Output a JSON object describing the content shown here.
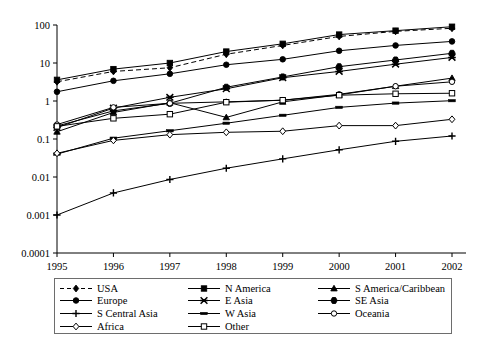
{
  "chart_data": {
    "type": "line",
    "title": "",
    "xlabel": "",
    "ylabel": "",
    "x": [
      "1995",
      "1996",
      "1997",
      "1998",
      "1999",
      "2000",
      "2001",
      "2002"
    ],
    "yscale": "log",
    "ylim": [
      0.0001,
      100
    ],
    "ytick_labels": [
      "100",
      "10",
      "1",
      "0.1",
      "0.01",
      "0.001",
      "0.0001"
    ],
    "ytick_values": [
      100,
      10,
      1,
      0.1,
      0.01,
      0.001,
      0.0001
    ],
    "grid": false,
    "legend_position": "below",
    "series": [
      {
        "name": "USA",
        "marker": "diamond-filled",
        "dash": true,
        "values": [
          3.2,
          6.0,
          7.5,
          17.0,
          29.0,
          50.0,
          68.0,
          82.0
        ]
      },
      {
        "name": "N America",
        "marker": "square-filled",
        "dash": false,
        "values": [
          3.6,
          6.9,
          10.0,
          20.0,
          32.0,
          56.0,
          71.0,
          90.0
        ]
      },
      {
        "name": "S America/Caribbean",
        "marker": "triangle-filled",
        "dash": false,
        "values": [
          0.155,
          0.5,
          0.9,
          0.37,
          0.95,
          1.45,
          2.45,
          4.0
        ]
      },
      {
        "name": "Europe",
        "marker": "circle-filled",
        "dash": false,
        "values": [
          1.75,
          3.4,
          5.2,
          9.0,
          12.5,
          21.0,
          29.0,
          37.0
        ]
      },
      {
        "name": "E Asia",
        "marker": "star-filled",
        "dash": false,
        "values": [
          0.2,
          0.65,
          1.25,
          2.1,
          4.1,
          6.0,
          9.3,
          14.0
        ]
      },
      {
        "name": "SE Asia",
        "marker": "hexagon-filled",
        "dash": false,
        "values": [
          0.22,
          0.55,
          0.87,
          2.3,
          4.3,
          8.0,
          12.0,
          18.0
        ]
      },
      {
        "name": "S Central Asia",
        "marker": "plus",
        "dash": false,
        "values": [
          0.001,
          0.0038,
          0.0086,
          0.017,
          0.03,
          0.052,
          0.087,
          0.12
        ]
      },
      {
        "name": "W Asia",
        "marker": "dash-filled",
        "dash": false,
        "values": [
          0.04,
          0.105,
          0.165,
          0.26,
          0.42,
          0.68,
          0.88,
          1.02
        ]
      },
      {
        "name": "Oceania",
        "marker": "circle-open",
        "dash": false,
        "values": [
          0.24,
          0.68,
          0.87,
          0.95,
          1.05,
          1.5,
          2.45,
          3.2
        ]
      },
      {
        "name": "Africa",
        "marker": "diamond-open",
        "dash": false,
        "values": [
          0.042,
          0.092,
          0.13,
          0.15,
          0.16,
          0.225,
          0.225,
          0.33
        ]
      },
      {
        "name": "Other",
        "marker": "square-open",
        "dash": false,
        "values": [
          0.215,
          0.35,
          0.45,
          0.93,
          1.05,
          1.42,
          1.55,
          1.6
        ]
      }
    ]
  },
  "legend": {
    "items": [
      {
        "label": "USA",
        "marker": "diamond-filled",
        "dash": true
      },
      {
        "label": "N America",
        "marker": "square-filled",
        "dash": false
      },
      {
        "label": "S America/Caribbean",
        "marker": "triangle-filled",
        "dash": false
      },
      {
        "label": "Europe",
        "marker": "circle-filled",
        "dash": false
      },
      {
        "label": "E Asia",
        "marker": "star-filled",
        "dash": false
      },
      {
        "label": "SE Asia",
        "marker": "hexagon-filled",
        "dash": false
      },
      {
        "label": "S Central Asia",
        "marker": "plus",
        "dash": false
      },
      {
        "label": "W Asia",
        "marker": "dash-filled",
        "dash": false
      },
      {
        "label": "Oceania",
        "marker": "circle-open",
        "dash": false
      },
      {
        "label": "Africa",
        "marker": "diamond-open",
        "dash": false
      },
      {
        "label": "Other",
        "marker": "square-open",
        "dash": false
      }
    ]
  },
  "colors": {
    "line": "#000000",
    "axis": "#000000",
    "legend_border": "#6d6d6d",
    "background": "#ffffff"
  }
}
